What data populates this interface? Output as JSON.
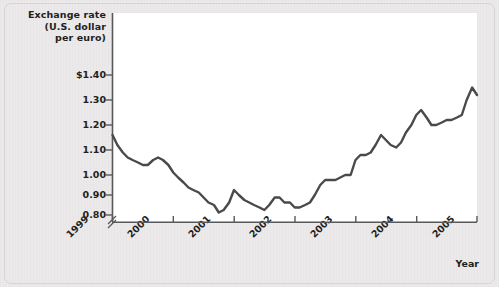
{
  "chart_data": {
    "type": "line",
    "title": "Exchange rate (U.S. dollar per euro)",
    "title_lines": [
      "Exchange rate",
      "(U.S. dollar",
      "per euro)"
    ],
    "xlabel": "Year",
    "ylabel": "Exchange rate (U.S. dollar per euro)",
    "xlim": [
      1999,
      2005
    ],
    "ylim": [
      0.8,
      1.4
    ],
    "y_axis_break": true,
    "grid": false,
    "legend": null,
    "line_color": "#4a4a4a",
    "panel_color": "#ffffff",
    "background_color": "#eceaea",
    "ytick_labels": [
      "$1.40",
      "1.30",
      "1.20",
      "1.10",
      "1.00",
      "0.90",
      "0.80"
    ],
    "ytick_values": [
      1.4,
      1.3,
      1.2,
      1.1,
      1.0,
      0.9,
      0.8
    ],
    "xtick_labels": [
      "1999",
      "2000",
      "2001",
      "2002",
      "2003",
      "2004",
      "2005"
    ],
    "xtick_values": [
      1999,
      2000,
      2001,
      2002,
      2003,
      2004,
      2005
    ],
    "series": [
      {
        "name": "U.S. dollar per euro",
        "x": [
          1999.0,
          1999.08,
          1999.17,
          1999.25,
          1999.33,
          1999.42,
          1999.5,
          1999.58,
          1999.67,
          1999.75,
          1999.83,
          1999.92,
          2000.0,
          2000.08,
          2000.17,
          2000.25,
          2000.33,
          2000.42,
          2000.5,
          2000.58,
          2000.67,
          2000.75,
          2000.83,
          2000.92,
          2001.0,
          2001.08,
          2001.17,
          2001.25,
          2001.33,
          2001.42,
          2001.5,
          2001.58,
          2001.67,
          2001.75,
          2001.83,
          2001.92,
          2002.0,
          2002.08,
          2002.17,
          2002.25,
          2002.33,
          2002.42,
          2002.5,
          2002.58,
          2002.67,
          2002.75,
          2002.83,
          2002.92,
          2003.0,
          2003.08,
          2003.17,
          2003.25,
          2003.33,
          2003.42,
          2003.5,
          2003.58,
          2003.67,
          2003.75,
          2003.83,
          2003.92,
          2004.0,
          2004.08,
          2004.17,
          2004.25,
          2004.33,
          2004.42,
          2004.5,
          2004.58,
          2004.67,
          2004.75,
          2004.83,
          2004.92,
          2005.0
        ],
        "y": [
          1.16,
          1.12,
          1.09,
          1.07,
          1.06,
          1.05,
          1.04,
          1.04,
          1.06,
          1.07,
          1.06,
          1.04,
          1.01,
          0.99,
          0.97,
          0.95,
          0.94,
          0.93,
          0.91,
          0.89,
          0.88,
          0.85,
          0.86,
          0.89,
          0.94,
          0.92,
          0.9,
          0.89,
          0.88,
          0.87,
          0.86,
          0.88,
          0.91,
          0.91,
          0.89,
          0.89,
          0.87,
          0.87,
          0.88,
          0.89,
          0.92,
          0.96,
          0.98,
          0.98,
          0.98,
          0.99,
          1.0,
          1.0,
          1.06,
          1.08,
          1.08,
          1.09,
          1.12,
          1.16,
          1.14,
          1.12,
          1.11,
          1.13,
          1.17,
          1.2,
          1.24,
          1.26,
          1.23,
          1.2,
          1.2,
          1.21,
          1.22,
          1.22,
          1.23,
          1.24,
          1.3,
          1.35,
          1.32
        ]
      }
    ]
  }
}
